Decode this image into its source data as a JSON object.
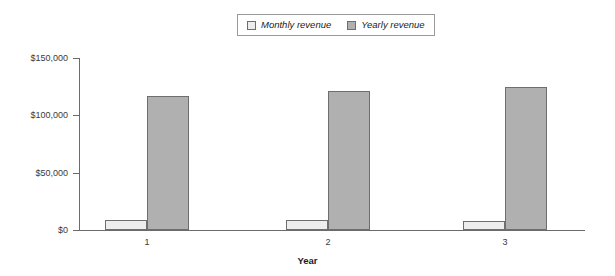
{
  "chart_data": {
    "type": "bar",
    "title": "",
    "subtitle": "",
    "xlabel": "Year",
    "ylabel": "",
    "categories": [
      "1",
      "2",
      "3"
    ],
    "series": [
      {
        "name": "Monthly revenue",
        "values": [
          9000,
          8300,
          7600
        ],
        "color": "#ededed"
      },
      {
        "name": "Yearly revenue",
        "values": [
          117000,
          121000,
          125000
        ],
        "color": "#b0b0b0"
      }
    ],
    "ylim": [
      0,
      150000
    ],
    "yticks": [
      0,
      50000,
      100000,
      150000
    ],
    "ytick_labels": [
      "$0",
      "$50,000",
      "$100,000",
      "$150,000"
    ],
    "grid": false,
    "legend_position": "top-center"
  },
  "legend": {
    "entries": [
      {
        "label": "Monthly revenue",
        "swatch_color": "#ededed"
      },
      {
        "label": "Yearly revenue",
        "swatch_color": "#b0b0b0"
      }
    ]
  },
  "axes": {
    "y_tick_labels": [
      "$150,000",
      "$100,000",
      "$50,000",
      "$0"
    ],
    "x_tick_labels": [
      "1",
      "2",
      "3"
    ],
    "x_axis_title": "Year"
  },
  "colors": {
    "monthly_bar": "#ededed",
    "yearly_bar": "#b0b0b0",
    "bar_outline": "#6e6e6e",
    "axis_line": "#6b6b6b",
    "text": "#3a3a3a",
    "background": "#ffffff"
  }
}
